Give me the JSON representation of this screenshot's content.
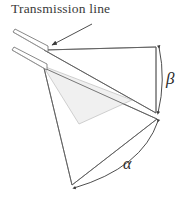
{
  "figure": {
    "title": "Transmission line",
    "background_color": "#ffffff",
    "stroke_color": "#555555",
    "fill_color": "#f0f0f0",
    "text_color": "#3a3a3a",
    "width": 190,
    "height": 200
  },
  "labels": {
    "transmission_line": "Transmission line",
    "angle_beta": "β",
    "angle_alpha": "α"
  },
  "elements": {
    "callout_arrow": "arrow-to-transmission-line",
    "feed_strip_upper": "transmission-line-strip-upper",
    "feed_strip_lower": "transmission-line-strip-lower",
    "flare_upper": "upper-flare-triangle",
    "flare_lower": "lower-flare-triangle",
    "flare_shaded": "shaded-inner-triangle",
    "arc_beta": "beta-angle-arc",
    "arc_alpha": "alpha-angle-arc"
  }
}
